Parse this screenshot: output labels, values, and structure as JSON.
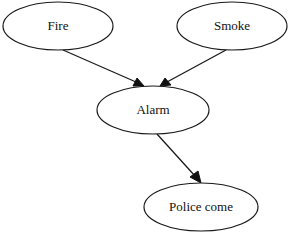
{
  "diagram": {
    "type": "directed-graph",
    "nodes": [
      {
        "id": "fire",
        "label": "Fire",
        "cx": 58,
        "cy": 26,
        "rx": 55,
        "ry": 24
      },
      {
        "id": "smoke",
        "label": "Smoke",
        "cx": 232,
        "cy": 26,
        "rx": 55,
        "ry": 24
      },
      {
        "id": "alarm",
        "label": "Alarm",
        "cx": 153,
        "cy": 110,
        "rx": 56,
        "ry": 24
      },
      {
        "id": "police",
        "label": "Police come",
        "cx": 201,
        "cy": 207,
        "rx": 57,
        "ry": 24
      }
    ],
    "edges": [
      {
        "from": "fire",
        "to": "alarm"
      },
      {
        "from": "smoke",
        "to": "alarm"
      },
      {
        "from": "alarm",
        "to": "police"
      }
    ],
    "colors": {
      "stroke": "#1a1a1a",
      "fill": "#ffffff",
      "text": "#111111"
    }
  }
}
